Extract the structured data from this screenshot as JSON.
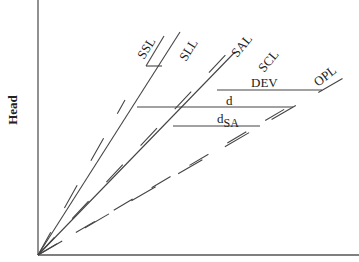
{
  "diagram": {
    "y_axis_label": "Head",
    "x_axis_label": "",
    "line_labels": {
      "ssl": "SSL",
      "sll": "SLL",
      "sal": "SAL",
      "scl": "SCL",
      "opl": "OPL"
    },
    "dimension_labels": {
      "dev": "DEV",
      "d": "d",
      "dsa_main": "d",
      "dsa_sub": "SA"
    }
  }
}
